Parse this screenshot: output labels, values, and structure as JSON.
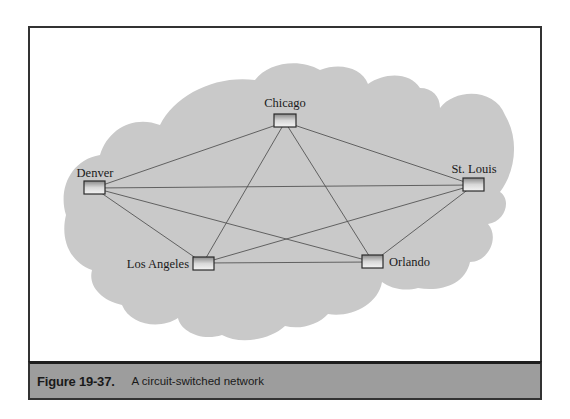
{
  "figure": {
    "caption_label": "Figure 19-37.",
    "caption_text": "A circuit-switched network"
  },
  "colors": {
    "cloud": "#c9c9c9",
    "caption_bar": "#9d9d9d",
    "frame_border": "#333333",
    "link_line": "#555555",
    "node_border": "#2a2a2a"
  },
  "network": {
    "nodes": [
      {
        "id": "chicago",
        "label": "Chicago"
      },
      {
        "id": "denver",
        "label": "Denver"
      },
      {
        "id": "st_louis",
        "label": "St. Louis"
      },
      {
        "id": "los_angeles",
        "label": "Los Angeles"
      },
      {
        "id": "orlando",
        "label": "Orlando"
      }
    ],
    "links": [
      [
        "chicago",
        "denver"
      ],
      [
        "chicago",
        "st_louis"
      ],
      [
        "chicago",
        "los_angeles"
      ],
      [
        "chicago",
        "orlando"
      ],
      [
        "denver",
        "st_louis"
      ],
      [
        "denver",
        "los_angeles"
      ],
      [
        "denver",
        "orlando"
      ],
      [
        "st_louis",
        "los_angeles"
      ],
      [
        "st_louis",
        "orlando"
      ],
      [
        "los_angeles",
        "orlando"
      ]
    ],
    "topology": "full mesh"
  }
}
